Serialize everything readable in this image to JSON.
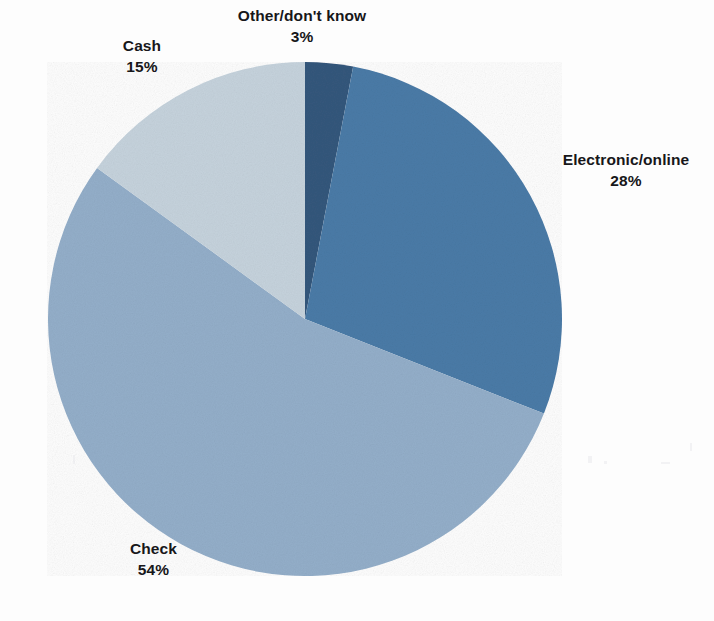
{
  "chart_data": {
    "type": "pie",
    "title": "",
    "subtitle": "",
    "xlabel": "",
    "ylabel": "",
    "legend_position": "none",
    "grid": false,
    "labels_shown": "category-name-and-percent",
    "start_angle_deg": 0,
    "direction": "clockwise",
    "categories": [
      "Other/don't know",
      "Electronic/online",
      "Check",
      "Cash"
    ],
    "values": [
      3,
      28,
      54,
      15
    ],
    "unit": "%",
    "colors": [
      "#34577c",
      "#4a7ba7",
      "#93aec9",
      "#c5d2dc"
    ],
    "slices": [
      {
        "label": "Other/don't know",
        "value": 3,
        "value_text": "3%",
        "color": "#34577c",
        "start_deg": 0,
        "end_deg": 10.8
      },
      {
        "label": "Electronic/online",
        "value": 28,
        "value_text": "28%",
        "color": "#4a7ba7",
        "start_deg": 10.8,
        "end_deg": 111.6
      },
      {
        "label": "Check",
        "value": 54,
        "value_text": "54%",
        "color": "#93aec9",
        "start_deg": 111.6,
        "end_deg": 306.0
      },
      {
        "label": "Cash",
        "value": 15,
        "value_text": "15%",
        "color": "#c5d2dc",
        "start_deg": 306.0,
        "end_deg": 360.0
      }
    ]
  },
  "canvas": {
    "background": "#fdfdfd",
    "center_x": 305,
    "center_y": 319,
    "radius": 257
  },
  "labels": {
    "other": {
      "name": "Other/don't know",
      "value": "3%"
    },
    "electronic": {
      "name": "Electronic/online",
      "value": "28%"
    },
    "check": {
      "name": "Check",
      "value": "54%"
    },
    "cash": {
      "name": "Cash",
      "value": "15%"
    }
  }
}
